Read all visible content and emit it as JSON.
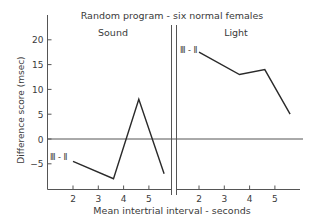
{
  "chart_data": {
    "type": "line",
    "title": "Random program - six normal females",
    "xlabel": "Mean intertrial interval - seconds",
    "ylabel": "Difference score (msec)",
    "ylim": [
      -10,
      23
    ],
    "yticks": [
      -5,
      0,
      5,
      10,
      15,
      20
    ],
    "xticks": [
      2,
      3,
      4,
      5
    ],
    "grid": false,
    "legend": "none",
    "reference_line": {
      "y": 0
    },
    "panels": [
      {
        "name": "Sound",
        "series": [
          {
            "name": "III - II",
            "x": [
              2,
              3.6,
              4.6,
              5.6
            ],
            "values": [
              -4.5,
              -8,
              8,
              -7
            ]
          }
        ]
      },
      {
        "name": "Light",
        "series": [
          {
            "name": "III - II",
            "x": [
              2,
              3.6,
              4.6,
              5.6
            ],
            "values": [
              17.5,
              13,
              14,
              5
            ]
          }
        ]
      }
    ]
  },
  "labels": {
    "title": "Random program - six normal females",
    "xlabel": "Mean intertrial interval - seconds",
    "ylabel": "Difference score (msec)",
    "panel_left": "Sound",
    "panel_right": "Light",
    "series_left": "Ⅲ - Ⅱ",
    "series_right": "Ⅲ - Ⅱ"
  },
  "colors": {
    "line": "#2a2a2a",
    "axis": "#555555",
    "text": "#3a3a3a",
    "background": "#ffffff"
  }
}
